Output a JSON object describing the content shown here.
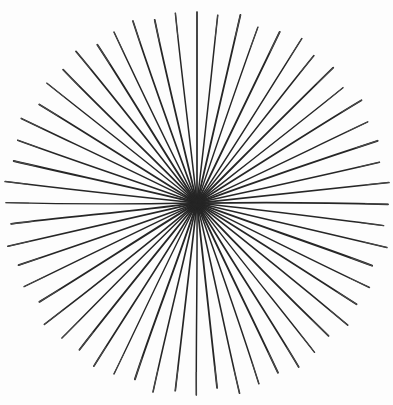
{
  "figure": {
    "caption": "",
    "kind": "radial-line-figure",
    "background_color": "#fdfdfd",
    "width": 393,
    "height": 405
  },
  "chart_data": {
    "type": "scatter",
    "subtitle": "",
    "xlabel": "",
    "ylabel": "",
    "grid": false,
    "legend_position": "none",
    "annotations": [],
    "tick_labels": [],
    "legend_entries": [],
    "render_style": "hand-drawn ink rays converging on a single point",
    "center": {
      "x": 197,
      "y": 203
    },
    "radius_mean": 191,
    "radius_jitter": 7,
    "ray_count": 56,
    "angle_step_deg": 6.4285714,
    "angle_jitter_deg": 1.15,
    "inner_gap_mean": 3.2,
    "inner_gap_jitter": 2.6,
    "line_color": "#262626",
    "line_color_light": "#4a4a4a",
    "line_width_min": 1.15,
    "line_width_max": 2.0,
    "wobble_amplitude": 1.5,
    "xlim": [
      0,
      393
    ],
    "ylim": [
      0,
      405
    ],
    "rays": [
      {
        "index": 0,
        "angle_deg": -90.0,
        "length": 191,
        "gap": 2.0,
        "width": 1.7
      },
      {
        "index": 1,
        "angle_deg": -83.7,
        "length": 189,
        "gap": 3.5,
        "width": 1.5
      },
      {
        "index": 2,
        "angle_deg": -77.0,
        "length": 193,
        "gap": 2.6,
        "width": 1.8
      },
      {
        "index": 3,
        "angle_deg": -70.9,
        "length": 186,
        "gap": 4.4,
        "width": 1.4
      },
      {
        "index": 4,
        "angle_deg": -64.2,
        "length": 190,
        "gap": 2.1,
        "width": 1.9
      },
      {
        "index": 5,
        "angle_deg": -57.5,
        "length": 195,
        "gap": 3.0,
        "width": 1.5
      },
      {
        "index": 6,
        "angle_deg": -51.6,
        "length": 188,
        "gap": 5.0,
        "width": 1.6
      },
      {
        "index": 7,
        "angle_deg": -44.8,
        "length": 192,
        "gap": 2.4,
        "width": 1.8
      },
      {
        "index": 8,
        "angle_deg": -38.3,
        "length": 186,
        "gap": 3.8,
        "width": 1.4
      },
      {
        "index": 9,
        "angle_deg": -32.0,
        "length": 194,
        "gap": 2.2,
        "width": 1.7
      },
      {
        "index": 10,
        "angle_deg": -25.4,
        "length": 189,
        "gap": 4.6,
        "width": 1.5
      },
      {
        "index": 11,
        "angle_deg": -19.0,
        "length": 191,
        "gap": 2.8,
        "width": 1.9
      },
      {
        "index": 12,
        "angle_deg": -12.6,
        "length": 187,
        "gap": 3.3,
        "width": 1.5
      },
      {
        "index": 13,
        "angle_deg": -6.1,
        "length": 193,
        "gap": 2.0,
        "width": 1.7
      },
      {
        "index": 14,
        "angle_deg": 0.4,
        "length": 191,
        "gap": 4.0,
        "width": 1.8
      },
      {
        "index": 15,
        "angle_deg": 6.9,
        "length": 188,
        "gap": 2.5,
        "width": 1.4
      },
      {
        "index": 16,
        "angle_deg": 13.2,
        "length": 195,
        "gap": 3.6,
        "width": 1.6
      },
      {
        "index": 17,
        "angle_deg": 19.7,
        "length": 186,
        "gap": 2.1,
        "width": 1.9
      },
      {
        "index": 18,
        "angle_deg": 26.1,
        "length": 192,
        "gap": 4.8,
        "width": 1.5
      },
      {
        "index": 19,
        "angle_deg": 32.4,
        "length": 189,
        "gap": 2.7,
        "width": 1.7
      },
      {
        "index": 20,
        "angle_deg": 39.0,
        "length": 194,
        "gap": 3.1,
        "width": 1.6
      },
      {
        "index": 21,
        "angle_deg": 45.3,
        "length": 187,
        "gap": 2.3,
        "width": 1.8
      },
      {
        "index": 22,
        "angle_deg": 51.8,
        "length": 190,
        "gap": 5.2,
        "width": 1.4
      },
      {
        "index": 23,
        "angle_deg": 58.2,
        "length": 193,
        "gap": 2.9,
        "width": 1.7
      },
      {
        "index": 24,
        "angle_deg": 64.5,
        "length": 188,
        "gap": 3.7,
        "width": 1.9
      },
      {
        "index": 25,
        "angle_deg": 71.1,
        "length": 191,
        "gap": 2.2,
        "width": 1.5
      },
      {
        "index": 26,
        "angle_deg": 77.4,
        "length": 195,
        "gap": 4.2,
        "width": 1.6
      },
      {
        "index": 27,
        "angle_deg": 83.8,
        "length": 186,
        "gap": 2.6,
        "width": 1.8
      },
      {
        "index": 28,
        "angle_deg": 90.2,
        "length": 192,
        "gap": 3.4,
        "width": 1.5
      },
      {
        "index": 29,
        "angle_deg": 96.6,
        "length": 189,
        "gap": 2.0,
        "width": 1.7
      },
      {
        "index": 30,
        "angle_deg": 103.1,
        "length": 194,
        "gap": 4.9,
        "width": 1.6
      },
      {
        "index": 31,
        "angle_deg": 109.4,
        "length": 187,
        "gap": 2.4,
        "width": 1.9
      },
      {
        "index": 32,
        "angle_deg": 115.9,
        "length": 190,
        "gap": 3.9,
        "width": 1.4
      },
      {
        "index": 33,
        "angle_deg": 122.3,
        "length": 193,
        "gap": 2.8,
        "width": 1.7
      },
      {
        "index": 34,
        "angle_deg": 128.7,
        "length": 188,
        "gap": 3.2,
        "width": 1.8
      },
      {
        "index": 35,
        "angle_deg": 135.0,
        "length": 191,
        "gap": 2.1,
        "width": 1.5
      },
      {
        "index": 36,
        "angle_deg": 141.5,
        "length": 195,
        "gap": 4.5,
        "width": 1.6
      },
      {
        "index": 37,
        "angle_deg": 147.9,
        "length": 186,
        "gap": 2.7,
        "width": 1.9
      },
      {
        "index": 38,
        "angle_deg": 154.2,
        "length": 192,
        "gap": 3.6,
        "width": 1.5
      },
      {
        "index": 39,
        "angle_deg": 160.8,
        "length": 189,
        "gap": 2.3,
        "width": 1.7
      },
      {
        "index": 40,
        "angle_deg": 167.1,
        "length": 194,
        "gap": 5.1,
        "width": 1.6
      },
      {
        "index": 41,
        "angle_deg": 173.6,
        "length": 187,
        "gap": 2.9,
        "width": 1.8
      },
      {
        "index": 42,
        "angle_deg": 180.1,
        "length": 191,
        "gap": 3.3,
        "width": 1.4
      },
      {
        "index": 43,
        "angle_deg": 186.4,
        "length": 193,
        "gap": 2.2,
        "width": 1.7
      },
      {
        "index": 44,
        "angle_deg": 192.9,
        "length": 188,
        "gap": 4.3,
        "width": 1.9
      },
      {
        "index": 45,
        "angle_deg": 199.3,
        "length": 190,
        "gap": 2.5,
        "width": 1.5
      },
      {
        "index": 46,
        "angle_deg": 205.7,
        "length": 195,
        "gap": 3.8,
        "width": 1.6
      },
      {
        "index": 47,
        "angle_deg": 212.0,
        "length": 186,
        "gap": 2.0,
        "width": 1.8
      },
      {
        "index": 48,
        "angle_deg": 218.6,
        "length": 192,
        "gap": 4.7,
        "width": 1.5
      },
      {
        "index": 49,
        "angle_deg": 224.9,
        "length": 189,
        "gap": 2.6,
        "width": 1.7
      },
      {
        "index": 50,
        "angle_deg": 231.4,
        "length": 194,
        "gap": 3.5,
        "width": 1.6
      },
      {
        "index": 51,
        "angle_deg": 237.8,
        "length": 187,
        "gap": 2.4,
        "width": 1.9
      },
      {
        "index": 52,
        "angle_deg": 244.1,
        "length": 190,
        "gap": 5.0,
        "width": 1.4
      },
      {
        "index": 53,
        "angle_deg": 250.6,
        "length": 193,
        "gap": 2.8,
        "width": 1.7
      },
      {
        "index": 54,
        "angle_deg": 257.0,
        "length": 188,
        "gap": 3.1,
        "width": 1.8
      },
      {
        "index": 55,
        "angle_deg": 263.5,
        "length": 191,
        "gap": 2.2,
        "width": 1.5
      }
    ]
  }
}
